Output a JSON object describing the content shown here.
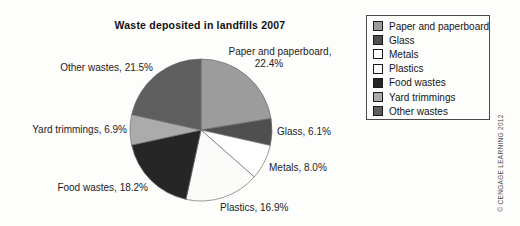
{
  "title": "Waste deposited in landfills 2007",
  "chart_data": {
    "type": "pie",
    "title": "Waste deposited in landfills 2007",
    "categories": [
      "Paper and paperboard",
      "Glass",
      "Metals",
      "Plastics",
      "Food wastes",
      "Yard trimmings",
      "Other wastes"
    ],
    "values": [
      22.4,
      6.1,
      8.0,
      16.9,
      18.2,
      6.9,
      21.5
    ],
    "unit": "%",
    "colors": [
      "#9c9c9c",
      "#4f4f4f",
      "#ffffff",
      "#fbfbfa",
      "#262626",
      "#ababab",
      "#5e5e5e"
    ],
    "start_angle_deg_from_12_oclock": 0,
    "direction": "clockwise",
    "legend_position": "right",
    "slice_labels": [
      "Paper and paperboard, 22.4%",
      "Glass, 6.1%",
      "Metals, 8.0%",
      "Plastics, 16.9%",
      "Food wastes, 18.2%",
      "Yard trimmings, 6.9%",
      "Other wastes, 21.5%"
    ]
  },
  "callouts": {
    "paper_line1": "Paper and paperboard,",
    "paper_line2": "22.4%",
    "glass": "Glass, 6.1%",
    "metals": "Metals, 8.0%",
    "plastics": "Plastics, 16.9%",
    "food": "Food wastes, 18.2%",
    "yard": "Yard trimmings, 6.9%",
    "other": "Other wastes, 21.5%"
  },
  "legend": {
    "items": [
      {
        "label": "Paper and paperboard",
        "color": "#9c9c9c"
      },
      {
        "label": "Glass",
        "color": "#4f4f4f"
      },
      {
        "label": "Metals",
        "color": "#ffffff"
      },
      {
        "label": "Plastics",
        "color": "#fbfbfa"
      },
      {
        "label": "Food wastes",
        "color": "#262626"
      },
      {
        "label": "Yard trimmings",
        "color": "#ababab"
      },
      {
        "label": "Other wastes",
        "color": "#5e5e5e"
      }
    ]
  },
  "credit": "© CENGAGE LEARNING 2012"
}
